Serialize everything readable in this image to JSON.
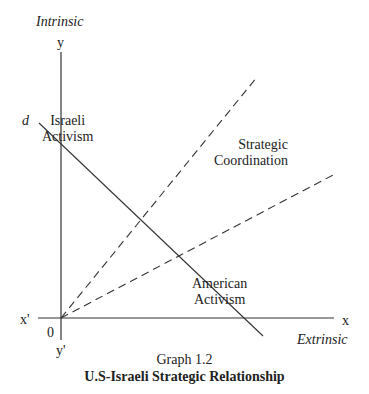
{
  "axes": {
    "y_axis_title": "Intrinsic",
    "y_label": "y",
    "y_prime_label": "y'",
    "x_label": "x",
    "x_prime_label": "x'",
    "x_axis_title": "Extrinsic",
    "origin_label": "0"
  },
  "lines": {
    "d_label": "d"
  },
  "regions": {
    "israeli_activism_line1": "Israeli",
    "israeli_activism_line2": "Activism",
    "strategic_coordination_line1": "Strategic",
    "strategic_coordination_line2": "Coordination",
    "american_activism_line1": "American",
    "american_activism_line2": "Activism"
  },
  "caption": {
    "graph_number": "Graph 1.2",
    "title": "U.S-Israeli Strategic Relationship"
  },
  "colors": {
    "line": "#333333",
    "text": "#222222",
    "background": "#ffffff"
  }
}
